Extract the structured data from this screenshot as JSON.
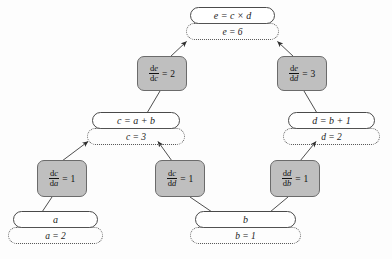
{
  "diagram": {
    "type": "computational-graph",
    "background_color": "#fdfdfd",
    "derivative_node_color": "#bfbfbf",
    "expression_node_color": "#ffffff",
    "edge_color": "#4a4a4a"
  },
  "nodes": {
    "e": {
      "expression": "e = c × d",
      "value": "e = 6",
      "name": "e"
    },
    "c": {
      "expression": "c = a + b",
      "value": "c = 3",
      "name": "c"
    },
    "d": {
      "expression": "d = b + 1",
      "value": "d = 2",
      "name": "d"
    },
    "a": {
      "expression": "a",
      "value": "a = 2",
      "name": "a"
    },
    "b": {
      "expression": "b",
      "value": "b = 1",
      "name": "b"
    }
  },
  "derivatives": {
    "de_dc": {
      "numerator_op": "d",
      "numerator_var": "e",
      "denominator_op": "d",
      "denominator_var": "c",
      "equals": "=",
      "value": "2",
      "label": "de/dc = 2"
    },
    "de_dd": {
      "numerator_op": "d",
      "numerator_var": "e",
      "denominator_op": "d",
      "denominator_var": "d",
      "equals": "=",
      "value": "3",
      "label": "de/dd = 3"
    },
    "dc_da": {
      "numerator_op": "d",
      "numerator_var": "c",
      "denominator_op": "d",
      "denominator_var": "a",
      "equals": "=",
      "value": "1",
      "label": "dc/da = 1"
    },
    "dc_dd": {
      "numerator_op": "d",
      "numerator_var": "c",
      "denominator_op": "d",
      "denominator_var": "d",
      "equals": "=",
      "value": "1",
      "label": "dc/dd = 1"
    },
    "dd_db": {
      "numerator_op": "d",
      "numerator_var": "d",
      "denominator_op": "d",
      "denominator_var": "b",
      "equals": "=",
      "value": "1",
      "label": "dd/db = 1"
    }
  },
  "edges": [
    {
      "from": "de_dc",
      "to": "e",
      "arrow": true
    },
    {
      "from": "de_dd",
      "to": "e",
      "arrow": true
    },
    {
      "from": "c",
      "to": "de_dc",
      "arrow": false
    },
    {
      "from": "d",
      "to": "de_dd",
      "arrow": false
    },
    {
      "from": "dc_da",
      "to": "c",
      "arrow": true
    },
    {
      "from": "dc_dd",
      "to": "c",
      "arrow": true
    },
    {
      "from": "dd_db",
      "to": "d",
      "arrow": true
    },
    {
      "from": "a",
      "to": "dc_da",
      "arrow": false
    },
    {
      "from": "b",
      "to": "dc_dd",
      "arrow": false
    },
    {
      "from": "b",
      "to": "dd_db",
      "arrow": false
    }
  ]
}
